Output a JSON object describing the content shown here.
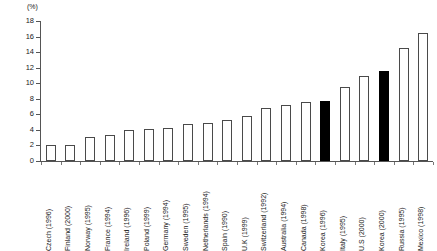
{
  "chart_data": {
    "type": "bar",
    "title": "",
    "subtitle": "",
    "xlabel": "",
    "ylabel": "",
    "unit_label": "(%)",
    "ylim": [
      0,
      18
    ],
    "ytick_step": 2,
    "yticks": [
      "18",
      "16",
      "14",
      "12",
      "10",
      "8",
      "6",
      "4",
      "2",
      "0"
    ],
    "grid": false,
    "legend": null,
    "highlight_color": "#000000",
    "bar_fill_color": "#ffffff",
    "bar_border_color": "#4a4a4a",
    "categories": [
      "Czech (1996)",
      "Finland (2000)",
      "Norway (1995)",
      "France (1994)",
      "Ireland (1996)",
      "Poland (1999)",
      "Germany (1994)",
      "Sweden (1995)",
      "Netherlands (1994)",
      "Spain (1990)",
      "U.K (1999)",
      "Switzerland (1992)",
      "Australia (1994)",
      "Canada (1998)",
      "Korea (1996)",
      "Italy (1995)",
      "U.S (2000)",
      "Korea (2000)",
      "Russia (1995)",
      "Mexico (1998)"
    ],
    "values": [
      2.0,
      2.1,
      3.1,
      3.4,
      4.0,
      4.1,
      4.2,
      4.7,
      4.9,
      5.3,
      5.8,
      6.8,
      7.2,
      7.6,
      7.7,
      9.5,
      10.9,
      11.6,
      14.5,
      16.4
    ],
    "highlighted": [
      false,
      false,
      false,
      false,
      false,
      false,
      false,
      false,
      false,
      false,
      false,
      false,
      false,
      false,
      true,
      false,
      false,
      true,
      false,
      false
    ]
  }
}
